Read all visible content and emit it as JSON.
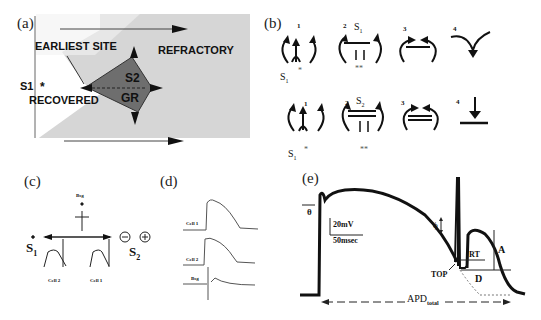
{
  "figure": {
    "panels": [
      {
        "id": "a",
        "label": "(a)"
      },
      {
        "id": "b",
        "label": "(b)"
      },
      {
        "id": "c",
        "label": "(c)"
      },
      {
        "id": "d",
        "label": "(d)"
      },
      {
        "id": "e",
        "label": "(e)"
      }
    ]
  },
  "panel_a": {
    "label": "(a)",
    "earliest_site": "EARLIEST SITE",
    "refractory": "REFRACTORY",
    "s1": "S1",
    "star": "*",
    "recovered": "RECOVERED",
    "s2": "S2",
    "gr": "GR",
    "colors": {
      "background": "#d4d4d4",
      "recovered_region": "#ffffff",
      "diamond": "#6e6e6e"
    }
  },
  "panel_b": {
    "label": "(b)",
    "rows": [
      {
        "steps": [
          "1",
          "2",
          "3",
          "4"
        ],
        "stim_label": "S",
        "stim_sub": "1",
        "s1_label": "S",
        "s1_sub": "1",
        "star": "*",
        "double_star": "**"
      },
      {
        "steps": [
          "1",
          "2",
          "3",
          "4"
        ],
        "stim_label": "S",
        "stim_sub": "2",
        "s1_label": "S",
        "s1_sub": "1",
        "star": "*",
        "double_star": "**"
      }
    ]
  },
  "panel_c": {
    "label": "(c)",
    "bsg": "Bsg",
    "s1": "S",
    "s1_sub": "1",
    "s2": "S",
    "s2_sub": "2",
    "minus": "⊖",
    "plus": "⊕",
    "cell2": "Cell 2",
    "cell1": "Cell 1"
  },
  "panel_d": {
    "label": "(d)",
    "traces": [
      "Cell 1",
      "Cell 2",
      "Bsg"
    ]
  },
  "panel_e": {
    "label": "(e)",
    "theta": "θ",
    "scale_v": "20mV",
    "scale_t": "50msec",
    "phi": "ϕ",
    "top": "TOP",
    "rt": "RT",
    "d": "D",
    "a": "A",
    "apd": "APD",
    "apd_sub": "total"
  }
}
